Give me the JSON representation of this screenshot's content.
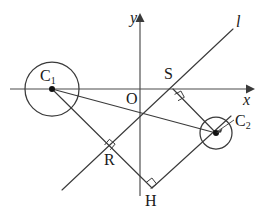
{
  "figure": {
    "kind": "geometry-diagram",
    "width": 262,
    "height": 217,
    "background_color": "#ffffff",
    "stroke_color": "#3a3a3a",
    "label_color": "#1a1a1a"
  },
  "labels": {
    "y_axis": "y",
    "x_axis": "x",
    "origin": "O",
    "line_l": "l",
    "circle1_center": "C",
    "circle1_center_sub": "1",
    "circle2_center": "C",
    "circle2_center_sub": "2",
    "point_s": "S",
    "point_r": "R",
    "point_h": "H"
  },
  "geometry": {
    "axes": {
      "x_axis": {
        "x1": 10,
        "y1": 89,
        "x2": 249,
        "y2": 89
      },
      "y_axis": {
        "x1": 140,
        "y1": 18,
        "x2": 140,
        "y2": 196
      },
      "origin": {
        "x": 140,
        "y": 89
      }
    },
    "circles": [
      {
        "name": "C1",
        "cx": 52,
        "cy": 89,
        "r": 27
      },
      {
        "name": "C2",
        "cx": 216,
        "cy": 133,
        "r": 16
      }
    ],
    "points": [
      {
        "name": "C1",
        "x": 52,
        "y": 89
      },
      {
        "name": "C2",
        "x": 216,
        "y": 133
      },
      {
        "name": "S",
        "x": 173,
        "y": 89
      },
      {
        "name": "R",
        "x": 110,
        "y": 146
      },
      {
        "name": "H",
        "x": 152,
        "y": 188
      },
      {
        "name": "O",
        "x": 140,
        "y": 89
      }
    ],
    "segments": [
      {
        "name": "C1-C2",
        "x1": 52,
        "y1": 89,
        "x2": 216,
        "y2": 133
      },
      {
        "name": "C1-H",
        "x1": 52,
        "y1": 89,
        "x2": 152,
        "y2": 188
      },
      {
        "name": "S-C2",
        "x1": 173,
        "y1": 89,
        "x2": 216,
        "y2": 133
      },
      {
        "name": "H-C2",
        "x1": 152,
        "y1": 188,
        "x2": 229,
        "y2": 118
      },
      {
        "name": "line-l",
        "x1": 62,
        "y1": 190,
        "x2": 232,
        "y2": 30
      }
    ],
    "right_angles": [
      {
        "name": "angle-at-S",
        "x": 179,
        "y": 96,
        "rotation": 45
      },
      {
        "name": "angle-at-R",
        "x": 110,
        "y": 142,
        "rotation": 45
      },
      {
        "name": "angle-at-H",
        "x": 152,
        "y": 183,
        "rotation": 45
      }
    ]
  }
}
